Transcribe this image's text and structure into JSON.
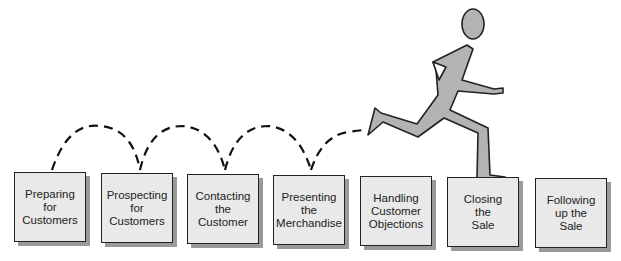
{
  "diagram": {
    "type": "process-flow",
    "steps": [
      {
        "label": "Preparing\nfor\nCustomers"
      },
      {
        "label": "Prospecting\nfor\nCustomers"
      },
      {
        "label": "Contacting\nthe\nCustomer"
      },
      {
        "label": "Presenting\nthe\nMerchandise"
      },
      {
        "label": "Handling\nCustomer\nObjections"
      },
      {
        "label": "Closing\nthe\nSale"
      },
      {
        "label": "Following\nup the\nSale"
      }
    ],
    "figure": "running-person",
    "colors": {
      "box_fill": "#e9e9e9",
      "box_border": "#222222",
      "shadow": "#9a9a9a",
      "figure_fill": "#b3b3b3"
    }
  }
}
